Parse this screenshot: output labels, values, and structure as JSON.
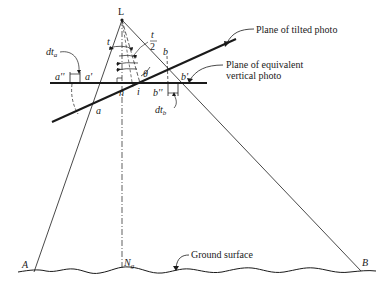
{
  "diagram": {
    "points": {
      "L": "L",
      "a": "a",
      "a_prime": "a'",
      "a_dprime": "a''",
      "b": "b",
      "b_prime": "b'",
      "b_dprime": "b''",
      "n": "n",
      "i": "i",
      "A": "A",
      "B": "B",
      "Ng_main": "N",
      "Ng_sub": "g"
    },
    "angles": {
      "t": "t",
      "t_half_num": "t",
      "t_half_den": "2",
      "theta": "θ"
    },
    "displacements": {
      "dta_main": "dt",
      "dta_sub": "a",
      "dtb_main": "dt",
      "dtb_sub": "b"
    },
    "callouts": {
      "tilted_plane": "Plane of tilted photo",
      "equivalent_plane_line1": "Plane of equivalent",
      "equivalent_plane_line2": "vertical photo",
      "ground": "Ground surface"
    },
    "colors": {
      "ink": "#1a1a1a",
      "background": "#ffffff"
    }
  }
}
